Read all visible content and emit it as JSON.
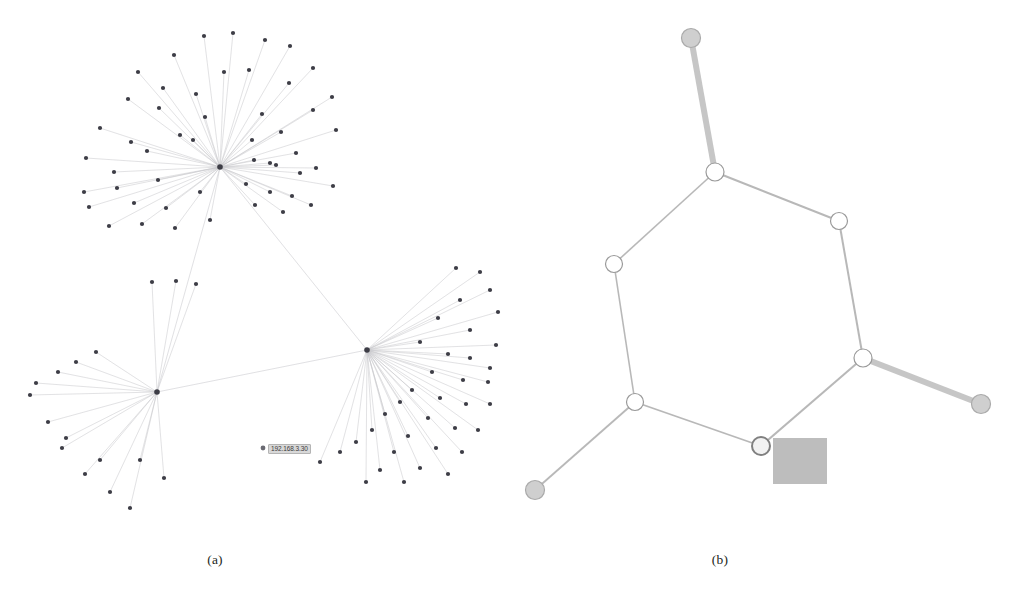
{
  "figure": {
    "panels": [
      {
        "id": "a",
        "caption": "(a)",
        "type": "force-directed-network",
        "description": "Large scale-free network with three hub-and-spoke star clusters",
        "node_color": "#3d3d46",
        "edge_color": "#c8c8cc",
        "hub_count": 3,
        "leaf_node_count": 98,
        "tooltip": {
          "text": "192.168.3.30",
          "x": 268,
          "y": 444,
          "background": "#d8d8d8",
          "border": "#b4b4b4"
        }
      },
      {
        "id": "b",
        "caption": "(b)",
        "type": "ring-network",
        "description": "Simplified cycle graph with seven ring nodes, three pendant leaves and one selected node with annotation square",
        "node_fill": "#ffffff",
        "node_stroke": "#9a9a9a",
        "leaf_fill": "#cfcfcf",
        "edge_color": "#b5b5b5",
        "thick_edge_color": "#c4c4c4",
        "annotation_square_color": "#bdbdbd",
        "selected_node_stroke": "#808080"
      }
    ]
  },
  "page_header": {
    "text": ""
  },
  "chart_data": [
    {
      "type": "scatter",
      "panel": "a",
      "title": "(a)",
      "xlabel": "",
      "ylabel": "",
      "xlim": [
        0,
        505
      ],
      "ylim": [
        0,
        545
      ],
      "grid": false,
      "legend": "none",
      "hubs": [
        {
          "id": "hub-1",
          "x": 220,
          "y": 167,
          "degree": 52
        },
        {
          "id": "hub-2",
          "x": 157,
          "y": 392,
          "degree": 17
        },
        {
          "id": "hub-3",
          "x": 367,
          "y": 350,
          "degree": 37
        }
      ],
      "hub1_leaves": [
        [
          138,
          72
        ],
        [
          174,
          55
        ],
        [
          204,
          36
        ],
        [
          233,
          33
        ],
        [
          265,
          40
        ],
        [
          290,
          46
        ],
        [
          313,
          68
        ],
        [
          332,
          97
        ],
        [
          128,
          99
        ],
        [
          159,
          108
        ],
        [
          205,
          117
        ],
        [
          224,
          72
        ],
        [
          249,
          70
        ],
        [
          289,
          83
        ],
        [
          100,
          128
        ],
        [
          131,
          142
        ],
        [
          163,
          88
        ],
        [
          196,
          94
        ],
        [
          86,
          158
        ],
        [
          114,
          172
        ],
        [
          147,
          151
        ],
        [
          180,
          135
        ],
        [
          84,
          192
        ],
        [
          117,
          188
        ],
        [
          158,
          180
        ],
        [
          193,
          140
        ],
        [
          89,
          207
        ],
        [
          134,
          203
        ],
        [
          166,
          208
        ],
        [
          200,
          192
        ],
        [
          109,
          226
        ],
        [
          142,
          224
        ],
        [
          175,
          228
        ],
        [
          210,
          220
        ],
        [
          262,
          114
        ],
        [
          281,
          132
        ],
        [
          296,
          153
        ],
        [
          313,
          110
        ],
        [
          336,
          130
        ],
        [
          254,
          160
        ],
        [
          276,
          165
        ],
        [
          300,
          173
        ],
        [
          246,
          184
        ],
        [
          270,
          192
        ],
        [
          292,
          196
        ],
        [
          316,
          168
        ],
        [
          255,
          205
        ],
        [
          283,
          212
        ],
        [
          311,
          205
        ],
        [
          333,
          186
        ],
        [
          270,
          163
        ],
        [
          252,
          140
        ]
      ],
      "hub2_leaves": [
        [
          30,
          395
        ],
        [
          48,
          422
        ],
        [
          62,
          448
        ],
        [
          85,
          474
        ],
        [
          110,
          492
        ],
        [
          130,
          508
        ],
        [
          152,
          282
        ],
        [
          176,
          281
        ],
        [
          196,
          284
        ],
        [
          58,
          372
        ],
        [
          76,
          362
        ],
        [
          96,
          352
        ],
        [
          36,
          383
        ],
        [
          66,
          438
        ],
        [
          100,
          460
        ],
        [
          140,
          460
        ],
        [
          164,
          478
        ]
      ],
      "hub3_leaves": [
        [
          456,
          268
        ],
        [
          480,
          272
        ],
        [
          490,
          290
        ],
        [
          460,
          300
        ],
        [
          498,
          312
        ],
        [
          438,
          318
        ],
        [
          470,
          330
        ],
        [
          496,
          345
        ],
        [
          420,
          342
        ],
        [
          448,
          354
        ],
        [
          470,
          358
        ],
        [
          490,
          368
        ],
        [
          432,
          372
        ],
        [
          463,
          380
        ],
        [
          488,
          382
        ],
        [
          412,
          390
        ],
        [
          440,
          398
        ],
        [
          466,
          404
        ],
        [
          490,
          404
        ],
        [
          400,
          402
        ],
        [
          428,
          418
        ],
        [
          455,
          428
        ],
        [
          478,
          430
        ],
        [
          385,
          414
        ],
        [
          408,
          436
        ],
        [
          436,
          448
        ],
        [
          462,
          452
        ],
        [
          372,
          430
        ],
        [
          394,
          452
        ],
        [
          420,
          468
        ],
        [
          448,
          474
        ],
        [
          356,
          442
        ],
        [
          380,
          470
        ],
        [
          404,
          482
        ],
        [
          340,
          452
        ],
        [
          366,
          482
        ],
        [
          320,
          462
        ]
      ]
    },
    {
      "type": "scatter",
      "panel": "b",
      "title": "(b)",
      "xlabel": "",
      "ylabel": "",
      "xlim": [
        0,
        506
      ],
      "ylim": [
        0,
        545
      ],
      "grid": false,
      "legend": "none",
      "nodes": [
        {
          "id": "n-top-leaf",
          "x": 186,
          "y": 38,
          "r": 9.5,
          "kind": "leaf",
          "label": ""
        },
        {
          "id": "n-top-junction",
          "x": 210,
          "y": 172,
          "r": 9,
          "kind": "ring",
          "label": ""
        },
        {
          "id": "n-right-upper",
          "x": 334,
          "y": 221,
          "r": 8.5,
          "kind": "ring",
          "label": ""
        },
        {
          "id": "n-left-upper",
          "x": 109,
          "y": 264,
          "r": 8.5,
          "kind": "ring",
          "label": ""
        },
        {
          "id": "n-right-mid",
          "x": 358,
          "y": 358,
          "r": 9,
          "kind": "ring",
          "label": ""
        },
        {
          "id": "n-left-lower",
          "x": 130,
          "y": 402,
          "r": 8.5,
          "kind": "ring",
          "label": ""
        },
        {
          "id": "n-bottom-center",
          "x": 256,
          "y": 446,
          "r": 9,
          "kind": "selected",
          "label": ""
        },
        {
          "id": "n-right-leaf",
          "x": 476,
          "y": 404,
          "r": 9.5,
          "kind": "leaf",
          "label": ""
        },
        {
          "id": "n-bottom-leaf",
          "x": 30,
          "y": 490,
          "r": 9.5,
          "kind": "leaf",
          "label": ""
        }
      ],
      "edges": [
        {
          "from": "n-top-leaf",
          "to": "n-top-junction",
          "weight": 6
        },
        {
          "from": "n-top-junction",
          "to": "n-right-upper",
          "weight": 2
        },
        {
          "from": "n-top-junction",
          "to": "n-left-upper",
          "weight": 1.6
        },
        {
          "from": "n-right-upper",
          "to": "n-right-mid",
          "weight": 2
        },
        {
          "from": "n-left-upper",
          "to": "n-left-lower",
          "weight": 1.6
        },
        {
          "from": "n-right-mid",
          "to": "n-right-leaf",
          "weight": 6
        },
        {
          "from": "n-right-mid",
          "to": "n-bottom-center",
          "weight": 2
        },
        {
          "from": "n-left-lower",
          "to": "n-bottom-center",
          "weight": 1.8
        },
        {
          "from": "n-left-lower",
          "to": "n-bottom-leaf",
          "weight": 1.8
        }
      ],
      "annotation_square": {
        "x": 268,
        "y": 438,
        "width": 54,
        "height": 46
      }
    }
  ]
}
